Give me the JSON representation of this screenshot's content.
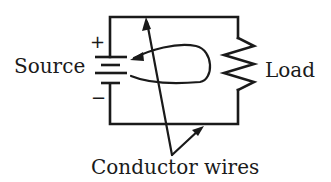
{
  "diagram": {
    "type": "electric-circuit",
    "labels": {
      "source": "Source",
      "load": "Load",
      "conductors": "Conductor wires"
    },
    "polarity": {
      "positive": "+",
      "negative": "−"
    },
    "components": [
      {
        "name": "battery",
        "role": "source"
      },
      {
        "name": "resistor",
        "role": "load"
      },
      {
        "name": "wires",
        "role": "conductor"
      }
    ],
    "colors": {
      "stroke": "#1a1a1a",
      "background": "#ffffff"
    }
  }
}
